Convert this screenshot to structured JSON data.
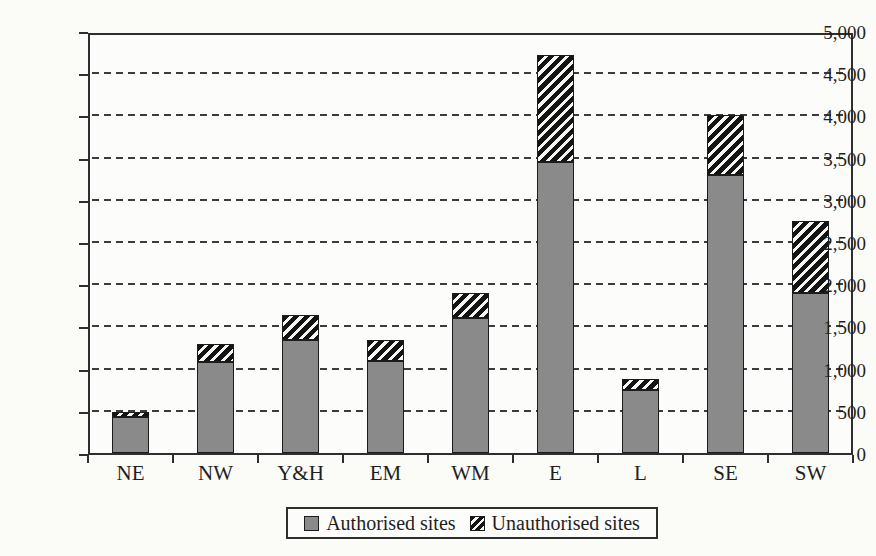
{
  "page": {
    "background": "#fbfbf8"
  },
  "chart_data": {
    "type": "bar",
    "variant": "stacked",
    "categories": [
      "NE",
      "NW",
      "Y&H",
      "EM",
      "WM",
      "E",
      "L",
      "SE",
      "SW"
    ],
    "series": [
      {
        "name": "Authorised sites",
        "swatch": "solid-gray",
        "values": [
          430,
          1080,
          1340,
          1090,
          1600,
          3450,
          750,
          3290,
          1900
        ]
      },
      {
        "name": "Unauthorised sites",
        "swatch": "diagonal-hatch",
        "values": [
          60,
          210,
          300,
          250,
          300,
          1270,
          130,
          710,
          850
        ]
      }
    ],
    "title": "",
    "xlabel": "",
    "ylabel": "",
    "ylim": [
      0,
      5000
    ],
    "ytick_step": 500,
    "ytick_labels": [
      "0",
      "500",
      "1,000",
      "1,500",
      "2,000",
      "2,500",
      "3,000",
      "3,500",
      "4,000",
      "4,500",
      "5,000"
    ],
    "grid": "horizontal-dashed",
    "legend_position": "bottom-center"
  },
  "legend": {
    "items": [
      {
        "label": "Authorised sites",
        "swatch": "solid-gray"
      },
      {
        "label": "Unauthorised sites",
        "swatch": "diagonal-hatch"
      }
    ]
  },
  "colors": {
    "authorised_fill": "#8a8a8a",
    "hatch_dark": "#141414",
    "hatch_light": "#f6f6f3",
    "axis": "#2e2e2e",
    "gridline": "#3c3c3c",
    "text": "#1f1f1f"
  }
}
